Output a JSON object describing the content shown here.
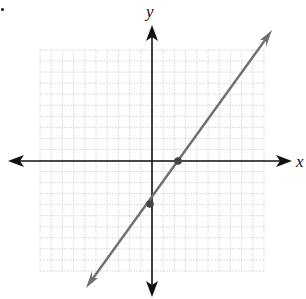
{
  "chart_data": {
    "type": "line",
    "title": "",
    "xlabel": "x",
    "ylabel": "y",
    "xlim": [
      -10,
      10
    ],
    "ylim": [
      -10,
      10
    ],
    "grid": true,
    "grid_spacing": 1,
    "series": [
      {
        "name": "line",
        "equation": "y = 2x - 4",
        "slope": 2,
        "intercept": -4,
        "x": [
          -3,
          7
        ],
        "y": [
          -10,
          10
        ],
        "marked_points": [
          {
            "x": 2,
            "y": 0,
            "label": "x-intercept"
          },
          {
            "x": 0,
            "y": -4,
            "label": "y-intercept"
          }
        ]
      }
    ]
  },
  "labels": {
    "x_axis": "x",
    "y_axis": "y",
    "bullet": "•"
  },
  "colors": {
    "axis": "#111111",
    "line": "#707070",
    "grid": "#d6d6d6",
    "point": "#444444"
  }
}
